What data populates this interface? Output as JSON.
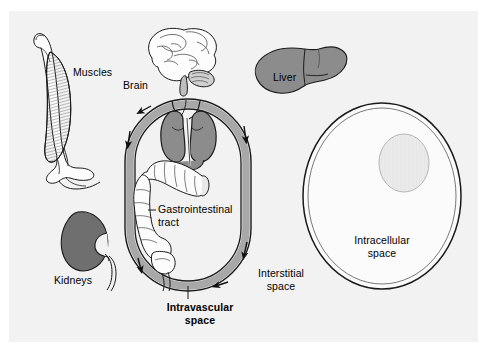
{
  "figure": {
    "width": 487,
    "height": 352,
    "background_color": "#ffffff",
    "panel_color": "#f2f2f2"
  },
  "colors": {
    "outline": "#1a1a1a",
    "organ_fill": "#8c8c8c",
    "vessel_fill": "#a8a8a8",
    "muscle_fill": "#9a9a9a",
    "nucleus_fill": "#ececec",
    "cell_fill": "#fbfbfb",
    "text": "#000000"
  },
  "labels": {
    "muscles": "Muscles",
    "brain": "Brain",
    "liver": "Liver",
    "kidneys": "Kidneys",
    "gastrointestinal_tract": "Gastrointestinal\ntract",
    "intravascular_space": "Intravascular\nspace",
    "interstitial_space": "Interstitial\nspace",
    "intracellular_space": "Intracellular\nspace"
  },
  "label_styles": {
    "intravascular_space_weight": "bold",
    "interstitial_space_weight": "normal",
    "intracellular_space_weight": "normal"
  },
  "structures": [
    {
      "name": "muscles",
      "kind": "organ-illustration",
      "has_leader": false
    },
    {
      "name": "brain",
      "kind": "organ-illustration",
      "has_leader": false
    },
    {
      "name": "liver",
      "kind": "organ-illustration",
      "has_leader": false
    },
    {
      "name": "kidneys",
      "kind": "organ-illustration",
      "has_leader": false
    },
    {
      "name": "heart",
      "kind": "organ-illustration",
      "has_leader": false
    },
    {
      "name": "gastrointestinal-tract",
      "kind": "organ-illustration",
      "has_leader": true
    },
    {
      "name": "vascular-loop",
      "kind": "compartment",
      "has_leader": true
    },
    {
      "name": "cell",
      "kind": "compartment",
      "has_leader": false
    },
    {
      "name": "nucleus",
      "kind": "organelle",
      "has_leader": false
    }
  ],
  "flow_arrows": {
    "count": 6,
    "description": "circulation direction arrows along vascular loop"
  }
}
